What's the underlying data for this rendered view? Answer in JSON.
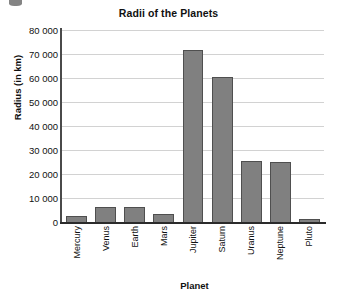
{
  "chart_data": {
    "type": "bar",
    "title": "Radii of the Planets",
    "xlabel": "Planet",
    "ylabel": "Radius (in km)",
    "categories": [
      "Mercury",
      "Venus",
      "Earth",
      "Mars",
      "Jupiter",
      "Saturn",
      "Uranus",
      "Neptune",
      "Pluto"
    ],
    "values": [
      2400,
      6100,
      6400,
      3400,
      71500,
      60300,
      25600,
      24800,
      1200
    ],
    "ylim": [
      0,
      80000
    ],
    "ytick_values": [
      80000,
      70000,
      60000,
      50000,
      40000,
      30000,
      20000,
      10000,
      0
    ],
    "ytick_labels": [
      "80 000",
      "70 000",
      "60 000",
      "50 000",
      "40 000",
      "30 000",
      "20 000",
      "10 000",
      "0"
    ],
    "grid": true,
    "legend": false,
    "bar_color": "#808080",
    "bar_edge_color": "#4f4f4f",
    "grid_color": "#d2d2d2",
    "axis_color": "#2b2b2b"
  }
}
